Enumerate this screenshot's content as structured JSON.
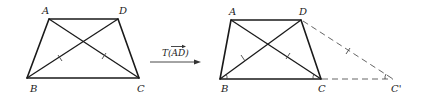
{
  "figure": {
    "left_trapezoid": {
      "labels": {
        "A": "A",
        "D": "D",
        "B": "B",
        "C": "C"
      }
    },
    "transformation": {
      "label_prefix": "T(",
      "vector": "AD",
      "label_suffix": ")"
    },
    "right_trapezoid": {
      "labels": {
        "A": "A",
        "D": "D",
        "B": "B",
        "C": "C",
        "C_prime": "C'"
      }
    }
  }
}
